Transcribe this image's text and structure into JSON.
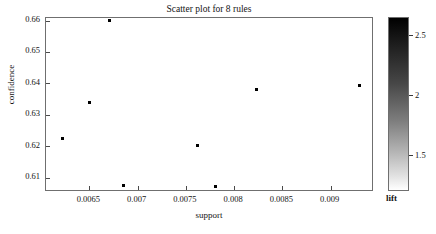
{
  "chart_data": {
    "type": "scatter",
    "title": "Scatter plot for 8 rules",
    "xlabel": "support",
    "ylabel": "confidence",
    "xlim": [
      0.00605,
      0.00945
    ],
    "ylim": [
      0.6055,
      0.6608
    ],
    "grid": false,
    "x": [
      0.00622,
      0.0065,
      0.00671,
      0.00685,
      0.00762,
      0.00781,
      0.00823,
      0.0093
    ],
    "y": [
      0.6226,
      0.6339,
      0.66,
      0.6075,
      0.6203,
      0.6072,
      0.6382,
      0.6395
    ],
    "points": [
      {
        "support": 0.00622,
        "confidence": 0.6226
      },
      {
        "support": 0.0065,
        "confidence": 0.6339
      },
      {
        "support": 0.00671,
        "confidence": 0.66
      },
      {
        "support": 0.00685,
        "confidence": 0.6075
      },
      {
        "support": 0.00762,
        "confidence": 0.6203
      },
      {
        "support": 0.00781,
        "confidence": 0.6072
      },
      {
        "support": 0.00823,
        "confidence": 0.6382
      },
      {
        "support": 0.0093,
        "confidence": 0.6395
      }
    ],
    "xticks": [
      0.0065,
      0.007,
      0.0075,
      0.008,
      0.0085,
      0.009
    ],
    "xtick_labels": [
      "0.0065",
      "0.007",
      "0.0075",
      "0.008",
      "0.0085",
      "0.009"
    ],
    "yticks": [
      0.61,
      0.62,
      0.63,
      0.64,
      0.65,
      0.66
    ],
    "ytick_labels": [
      "0.61",
      "0.62",
      "0.63",
      "0.64",
      "0.65",
      "0.66"
    ],
    "marker": "dot",
    "marker_color": "#000000",
    "colorbar": {
      "title": "lift",
      "ticks": [
        1.5,
        2,
        2.5
      ],
      "tick_labels": [
        "1.5",
        "2",
        "2.5"
      ],
      "range": [
        1.2,
        2.65
      ],
      "colormap": "gray-reversed",
      "low_color": "#ffffff",
      "high_color": "#000000"
    }
  }
}
